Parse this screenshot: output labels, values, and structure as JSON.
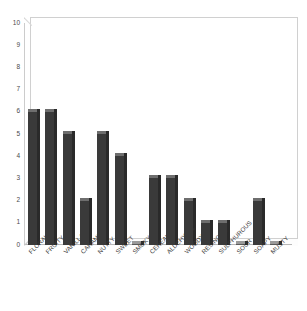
{
  "chart_data": {
    "type": "bar",
    "title": "",
    "subtitle": "",
    "xlabel": "",
    "ylabel": "",
    "ylim": [
      0,
      10
    ],
    "yticks": [
      "0",
      "1",
      "2",
      "3",
      "4",
      "5",
      "6",
      "7",
      "8",
      "9",
      "10"
    ],
    "grid": false,
    "legend": false,
    "orientation": "vertical",
    "style": "3d-columns",
    "bar_color": "#3a3a3a",
    "bar_top_color": "#6e6e6e",
    "bar_side_color": "#2a2a2a",
    "frame_color": "#d0d0d0",
    "categories": [
      "FLORAL",
      "FRUITY",
      "VANILLA",
      "CARAMEL",
      "NUTTY",
      "SWEET",
      "SMOKY",
      "CEREAL",
      "ALDEHYDIC",
      "WOODY",
      "RESINOUS",
      "SULPHUROUS",
      "SOUR",
      "SOAPY",
      "MUSTY"
    ],
    "values": [
      6,
      6,
      5,
      2,
      5,
      4,
      0,
      3,
      3,
      2,
      1,
      1,
      0,
      2,
      0
    ]
  }
}
